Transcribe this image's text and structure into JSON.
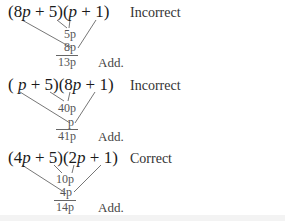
{
  "trials": [
    {
      "expression": "(8p + 5)(p + 1)",
      "factor1": {
        "open": "(",
        "coef": "8",
        "var": "p",
        "rest": " + 5)"
      },
      "factor2": {
        "open": "(",
        "coef": "",
        "var": "p",
        "rest": " + 1)"
      },
      "inner_product": "5p",
      "outer_product": "8p",
      "sum": "13p",
      "add_label": "Add.",
      "verdict": "Incorrect"
    },
    {
      "expression": "(p + 5)(8p + 1)",
      "factor1": {
        "open": "( ",
        "coef": "",
        "var": "p",
        "rest": " + 5)"
      },
      "factor2": {
        "open": "(",
        "coef": "8",
        "var": "p",
        "rest": " + 1)"
      },
      "inner_product": "40p",
      "outer_product": "p",
      "sum": "41p",
      "add_label": "Add.",
      "verdict": "Incorrect"
    },
    {
      "expression": "(4p + 5)(2p + 1)",
      "factor1": {
        "open": "(",
        "coef": "4",
        "var": "p",
        "rest": " + 5)"
      },
      "factor2": {
        "open": "(",
        "coef": "2",
        "var": "p",
        "rest": " + 1)"
      },
      "inner_product": "10p",
      "outer_product": "4p",
      "sum": "14p",
      "add_label": "Add.",
      "verdict": "Correct"
    }
  ]
}
